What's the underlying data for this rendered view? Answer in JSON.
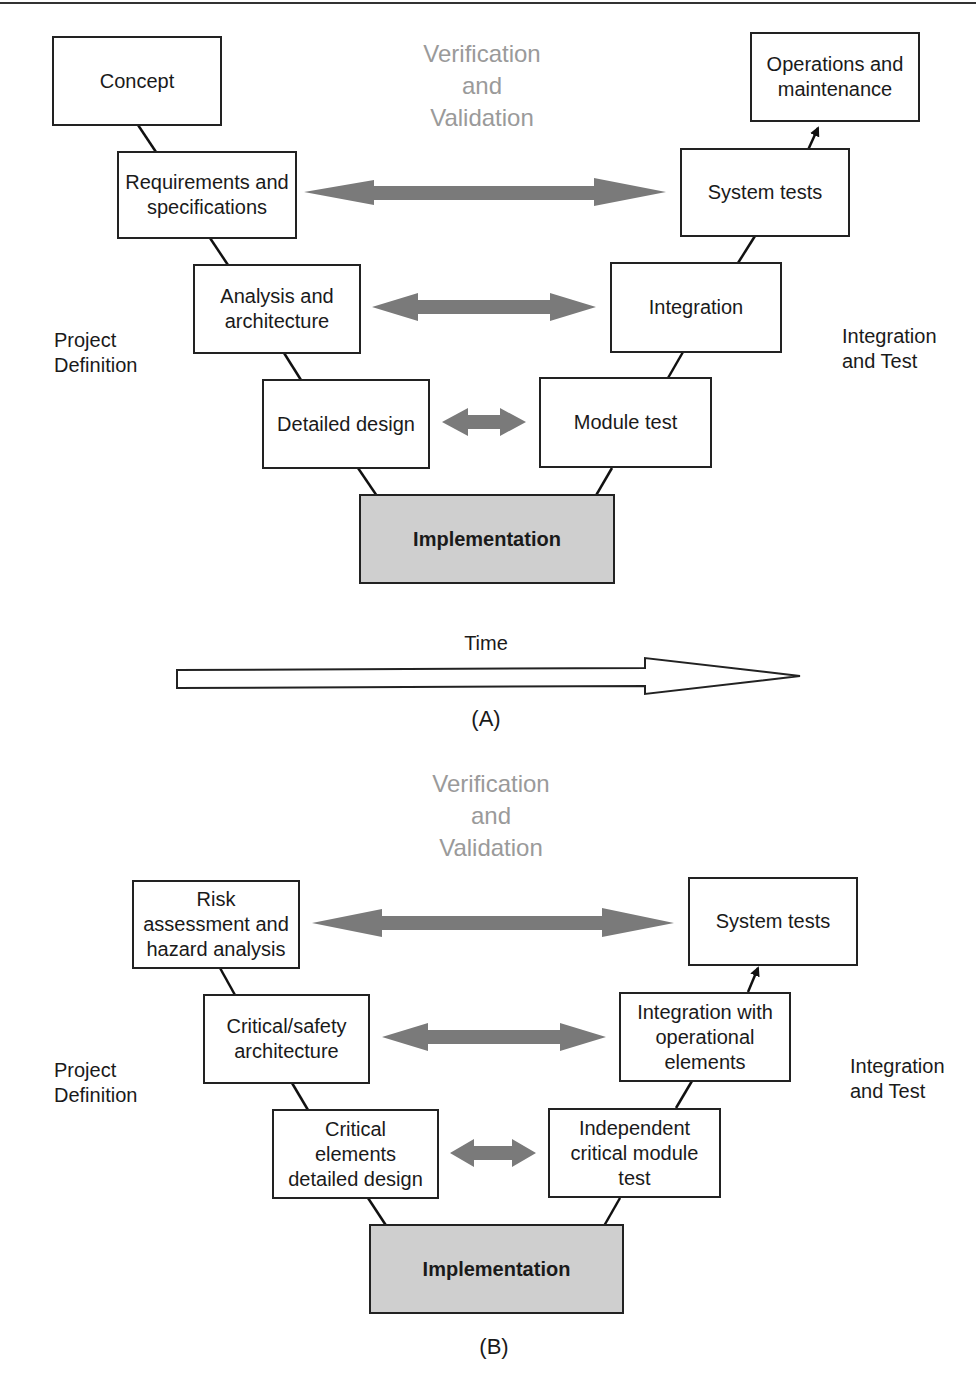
{
  "colors": {
    "arrow": "#7a7a7a",
    "box_border": "#222222",
    "impl_fill": "#cfcfcf",
    "vv_text": "#9a9a9a"
  },
  "diagram_a": {
    "caption": "(A)",
    "vv_label": "Verification\nand\nValidation",
    "left_phase": "Project\nDefinition",
    "right_phase": "Integration\nand Test",
    "time_label": "Time",
    "boxes": {
      "concept": "Concept",
      "requirements": "Requirements and\nspecifications",
      "analysis": "Analysis and\narchitecture",
      "detailed_design": "Detailed design",
      "implementation": "Implementation",
      "module_test": "Module test",
      "integration": "Integration",
      "system_tests": "System tests",
      "operations": "Operations and\nmaintenance"
    }
  },
  "diagram_b": {
    "caption": "(B)",
    "vv_label": "Verification\nand\nValidation",
    "left_phase": "Project\nDefinition",
    "right_phase": "Integration\nand Test",
    "boxes": {
      "risk": "Risk\nassessment and\nhazard analysis",
      "critical_arch": "Critical/safety\narchitecture",
      "critical_design": "Critical\nelements\ndetailed design",
      "implementation": "Implementation",
      "independent_test": "Independent\ncritical module\ntest",
      "integration_ops": "Integration with\noperational\nelements",
      "system_tests": "System tests"
    }
  }
}
